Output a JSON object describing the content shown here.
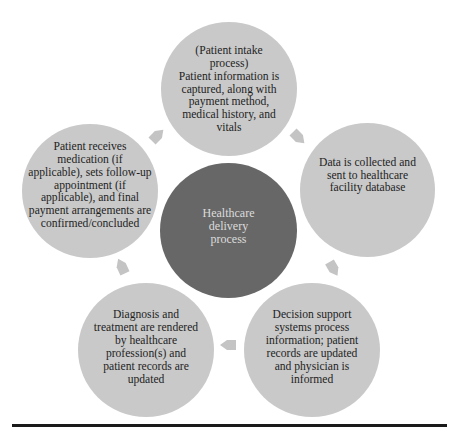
{
  "diagram": {
    "center": {
      "label": "Healthcare\ndelivery\nprocess"
    },
    "steps": [
      {
        "id": "intake",
        "label": "(Patient intake\nprocess)\nPatient information is\ncaptured, along with\npayment method,\nmedical history, and\nvitals"
      },
      {
        "id": "data-collection",
        "label": "Data is collected and\nsent to healthcare\nfacility database"
      },
      {
        "id": "decision-support",
        "label": "Decision support\nsystems process\ninformation; patient\nrecords are updated\nand physician is\ninformed"
      },
      {
        "id": "diagnosis",
        "label": "Diagnosis and\ntreatment are rendered\nby healthcare\nprofession(s) and\npatient records are\nupdated"
      },
      {
        "id": "discharge",
        "label": "Patient receives\nmedication (if\napplicable), sets follow-up\nappointment (if\napplicable), and final\npayment arrangements are\nconfirmed/concluded"
      }
    ],
    "arrows": [
      {
        "from": "intake",
        "to": "data-collection",
        "direction": "down-right"
      },
      {
        "from": "data-collection",
        "to": "decision-support",
        "direction": "down"
      },
      {
        "from": "decision-support",
        "to": "diagnosis",
        "direction": "left"
      },
      {
        "from": "diagnosis",
        "to": "discharge",
        "direction": "up"
      },
      {
        "from": "discharge",
        "to": "intake",
        "direction": "up-right"
      }
    ],
    "colors": {
      "outer_fill": "#c9c9c9",
      "center_fill": "#676767",
      "arrow_fill": "#c4c4c4",
      "outer_text": "#1e1e1e",
      "center_text": "#dcdcdc",
      "rule": "#1a1a1a"
    }
  }
}
